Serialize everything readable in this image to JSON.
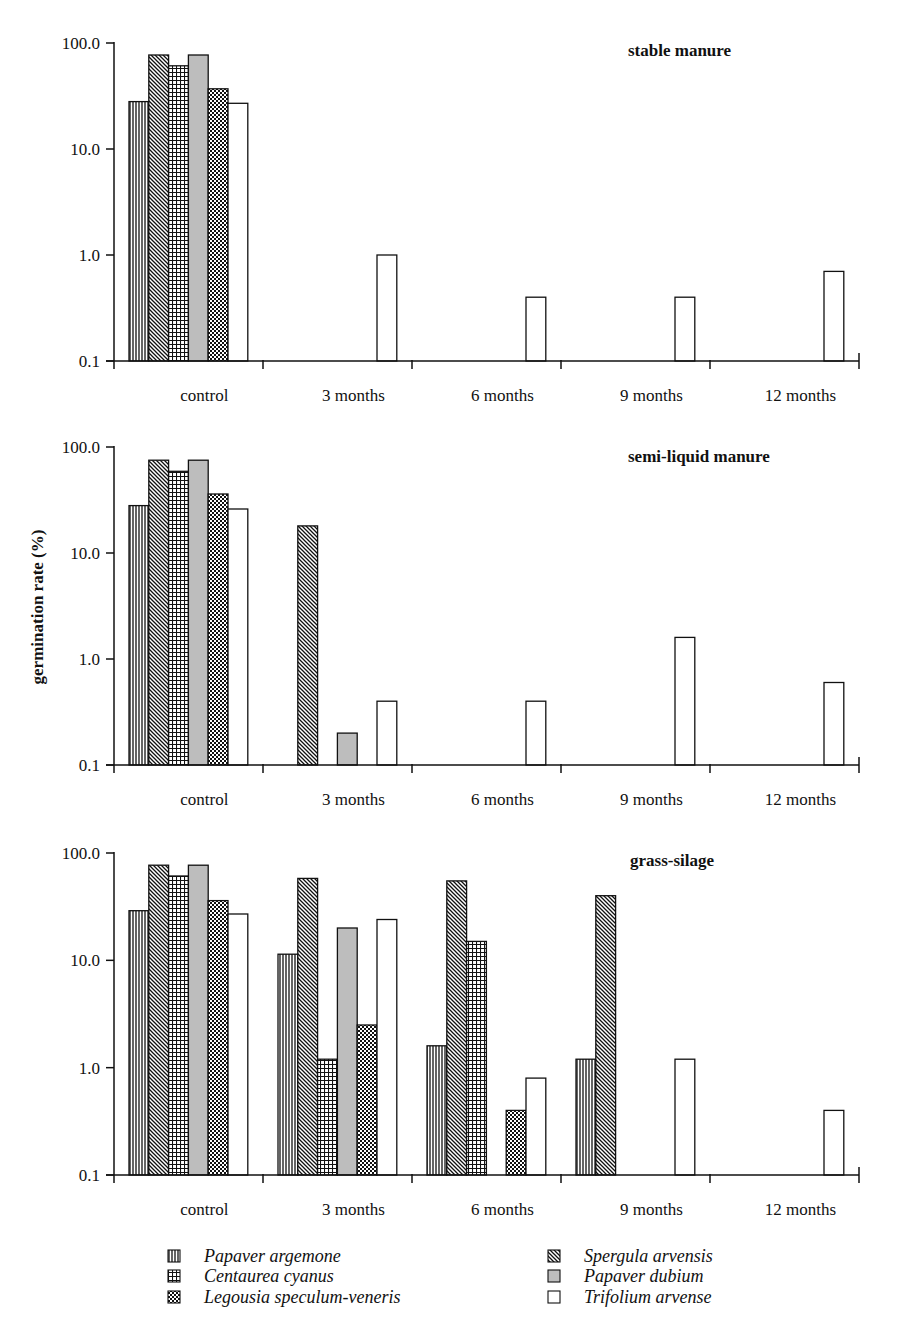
{
  "chart_data": {
    "type": "bar",
    "ylabel": "germination rate (%)",
    "yscale": "log",
    "ylim": [
      0.1,
      100.0
    ],
    "yticks": [
      "100.0",
      "10.0",
      "1.0",
      "0.1"
    ],
    "categories": [
      "control",
      "3 months",
      "6 months",
      "9 months",
      "12 months"
    ],
    "legend": {
      "placement": "bottom",
      "entries": [
        {
          "name": "Papaver argemone",
          "pattern": "vertical-lines",
          "fill": "#ffffff"
        },
        {
          "name": "Spergula arvensis",
          "pattern": "diagonal-lines",
          "fill": "#ffffff"
        },
        {
          "name": "Centaurea cyanus",
          "pattern": "grid",
          "fill": "#ffffff"
        },
        {
          "name": "Papaver dubium",
          "pattern": "solid",
          "fill": "#bdbdbd"
        },
        {
          "name": "Legousia speculum-veneris",
          "pattern": "checker",
          "fill": "#ffffff"
        },
        {
          "name": "Trifolium arvense",
          "pattern": "none",
          "fill": "#ffffff"
        }
      ]
    },
    "panels": [
      {
        "title": "stable manure",
        "series": [
          {
            "name": "Papaver argemone",
            "values": [
              28,
              null,
              null,
              null,
              null
            ]
          },
          {
            "name": "Spergula arvensis",
            "values": [
              77,
              null,
              null,
              null,
              null
            ]
          },
          {
            "name": "Centaurea cyanus",
            "values": [
              61,
              null,
              null,
              null,
              null
            ]
          },
          {
            "name": "Papaver dubium",
            "values": [
              77,
              null,
              null,
              null,
              null
            ]
          },
          {
            "name": "Legousia speculum-veneris",
            "values": [
              37,
              null,
              null,
              null,
              null
            ]
          },
          {
            "name": "Trifolium arvense",
            "values": [
              27,
              1.0,
              0.4,
              0.4,
              0.7
            ]
          }
        ]
      },
      {
        "title": "semi-liquid manure",
        "series": [
          {
            "name": "Papaver argemone",
            "values": [
              28,
              null,
              null,
              null,
              null
            ]
          },
          {
            "name": "Spergula arvensis",
            "values": [
              75,
              18,
              null,
              null,
              null
            ]
          },
          {
            "name": "Centaurea cyanus",
            "values": [
              59,
              null,
              null,
              null,
              null
            ]
          },
          {
            "name": "Papaver dubium",
            "values": [
              75,
              0.2,
              null,
              null,
              null
            ]
          },
          {
            "name": "Legousia speculum-veneris",
            "values": [
              36,
              null,
              null,
              null,
              null
            ]
          },
          {
            "name": "Trifolium arvense",
            "values": [
              26,
              0.4,
              0.4,
              1.6,
              0.6
            ]
          }
        ]
      },
      {
        "title": "grass-silage",
        "series": [
          {
            "name": "Papaver argemone",
            "values": [
              29,
              11.4,
              1.6,
              1.2,
              null
            ]
          },
          {
            "name": "Spergula arvensis",
            "values": [
              77,
              58,
              55,
              40,
              null
            ]
          },
          {
            "name": "Centaurea cyanus",
            "values": [
              61,
              1.2,
              15,
              null,
              null
            ]
          },
          {
            "name": "Papaver dubium",
            "values": [
              77,
              20,
              null,
              null,
              null
            ]
          },
          {
            "name": "Legousia speculum-veneris",
            "values": [
              36,
              2.5,
              0.4,
              null,
              null
            ]
          },
          {
            "name": "Trifolium arvense",
            "values": [
              27,
              24,
              0.8,
              1.2,
              0.4
            ]
          }
        ]
      }
    ]
  }
}
